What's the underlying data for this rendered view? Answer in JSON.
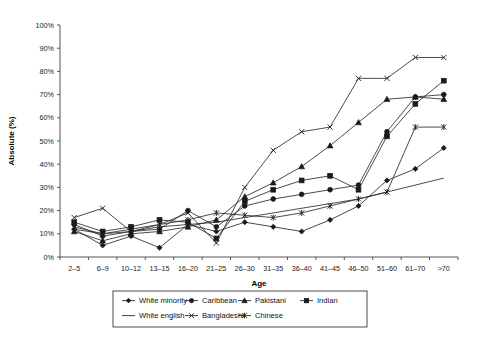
{
  "chart_data": {
    "type": "line",
    "title": "",
    "xlabel": "Age",
    "ylabel": "Absolute (%)",
    "categories": [
      "2–5",
      "6–9",
      "10–12",
      "13–15",
      "16–20",
      "21–25",
      "26–30",
      "31–35",
      "36–40",
      "41–45",
      "46–50",
      "51–60",
      "61–70",
      ">70"
    ],
    "ylim": [
      0,
      100
    ],
    "ytick_labels": [
      "0%",
      "10%",
      "20%",
      "30%",
      "40%",
      "50%",
      "60%",
      "70%",
      "80%",
      "90%",
      "100%"
    ],
    "ytick_values": [
      0,
      10,
      20,
      30,
      40,
      50,
      60,
      70,
      80,
      90,
      100
    ],
    "grid": false,
    "legend_position": "bottom",
    "series": [
      {
        "name": "White minority",
        "marker": "diamond",
        "values": [
          12,
          5,
          9,
          4,
          14,
          11,
          15,
          13,
          11,
          16,
          22,
          33,
          38,
          47
        ]
      },
      {
        "name": "Caribbean",
        "marker": "circle",
        "values": [
          14,
          9,
          11,
          12,
          20,
          13,
          22,
          25,
          27,
          29,
          31,
          54,
          69,
          70
        ]
      },
      {
        "name": "Pakistani",
        "marker": "triangle",
        "values": [
          11,
          7,
          10,
          11,
          13,
          16,
          26,
          32,
          39,
          48,
          58,
          68,
          69,
          68
        ]
      },
      {
        "name": "Indian",
        "marker": "square",
        "values": [
          15,
          11,
          13,
          16,
          15,
          8,
          24,
          29,
          33,
          35,
          29,
          52,
          66,
          76
        ]
      },
      {
        "name": "White english",
        "marker": "none",
        "values": [
          12,
          10,
          11,
          13,
          14,
          15,
          17,
          19,
          21,
          23,
          25,
          28,
          31,
          34
        ]
      },
      {
        "name": "Bangladeshi",
        "marker": "cross",
        "values": [
          17,
          21,
          11,
          14,
          19,
          6,
          30,
          46,
          54,
          56,
          77,
          77,
          86,
          86
        ]
      },
      {
        "name": "Chinese",
        "marker": "asterisk",
        "values": [
          13,
          10,
          12,
          14,
          16,
          19,
          18,
          17,
          19,
          22,
          25,
          28,
          56,
          56
        ]
      }
    ]
  },
  "legend": {
    "items": [
      {
        "label": "White minority",
        "marker": "diamond"
      },
      {
        "label": "Caribbean",
        "marker": "circle"
      },
      {
        "label": "Pakistani",
        "marker": "triangle"
      },
      {
        "label": "Indian",
        "marker": "square"
      },
      {
        "label": "White english",
        "marker": "none"
      },
      {
        "label": "Bangladeshi",
        "marker": "cross"
      },
      {
        "label": "Chinese",
        "marker": "asterisk"
      }
    ]
  }
}
